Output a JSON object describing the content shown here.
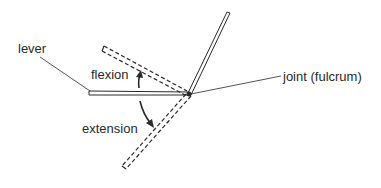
{
  "diagram": {
    "labels": {
      "lever": "lever",
      "flexion": "flexion",
      "extension": "extension",
      "joint": "joint (fulcrum)"
    },
    "colors": {
      "ink": "#2a2a2a",
      "background": "#ffffff"
    }
  }
}
